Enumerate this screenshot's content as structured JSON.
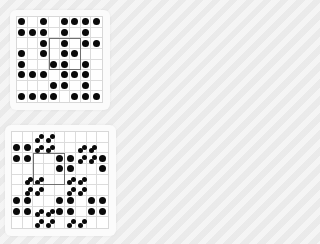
{
  "puzzles": [
    {
      "name": "top-puzzle",
      "cols": 8,
      "rows": 8,
      "cells": [
        [
          "dot",
          "",
          "dot",
          "",
          "dot",
          "dot",
          "dot",
          "dot"
        ],
        [
          "dot",
          "dot",
          "dot",
          "",
          "dot",
          "",
          "dot",
          ""
        ],
        [
          "",
          "",
          "dot",
          "",
          "dot",
          "",
          "dot",
          "dot"
        ],
        [
          "dot",
          "",
          "dot",
          "",
          "dot",
          "dot",
          "",
          ""
        ],
        [
          "dot",
          "",
          "",
          "dot",
          "dot",
          "",
          "dot",
          ""
        ],
        [
          "dot",
          "dot",
          "dot",
          "",
          "dot",
          "dot",
          "dot",
          ""
        ],
        [
          "",
          "",
          "",
          "dot",
          "dot",
          "",
          "dot",
          ""
        ],
        [
          "dot",
          "dot",
          "dot",
          "dot",
          "",
          "dot",
          "dot",
          "dot"
        ]
      ],
      "selection": {
        "col": 3,
        "row": 2,
        "width": 3,
        "height": 3
      }
    },
    {
      "name": "bottom-puzzle",
      "cols": 9,
      "rows": 9,
      "cells": [
        [
          "",
          "",
          "pair",
          "pair",
          "",
          "",
          "",
          "",
          ""
        ],
        [
          "dot",
          "dot",
          "pair",
          "pair",
          "",
          "",
          "pair",
          "pair",
          ""
        ],
        [
          "dot",
          "dot",
          "",
          "",
          "dot",
          "dot",
          "pair",
          "pair",
          "dot"
        ],
        [
          "",
          "",
          "",
          "",
          "dot",
          "dot",
          "",
          "",
          "dot"
        ],
        [
          "",
          "pair",
          "pair",
          "",
          "",
          "pair",
          "pair",
          "",
          ""
        ],
        [
          "",
          "pair",
          "pair",
          "",
          "",
          "pair",
          "pair",
          "",
          ""
        ],
        [
          "dot",
          "dot",
          "",
          "",
          "dot",
          "dot",
          "",
          "dot",
          "dot"
        ],
        [
          "dot",
          "dot",
          "pair",
          "pair",
          "dot",
          "dot",
          "",
          "dot",
          "dot"
        ],
        [
          "",
          "",
          "pair",
          "pair",
          "",
          "pair",
          "pair",
          "",
          ""
        ]
      ],
      "selection": {
        "col": 2,
        "row": 2,
        "width": 3,
        "height": 3
      }
    }
  ],
  "colors": {
    "piece": "#0a0a0a",
    "grid_line": "#dcdcdc",
    "selection_border": "#707070",
    "card": "#fbfbfb",
    "background": "#efefef"
  }
}
